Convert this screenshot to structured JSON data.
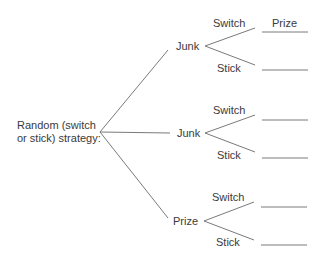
{
  "root": {
    "line1": "Random (switch",
    "line2": "or stick) strategy:"
  },
  "column_header": "Prize",
  "branches": [
    {
      "label": "Junk",
      "options": [
        {
          "label": "Switch",
          "result": ""
        },
        {
          "label": "Stick",
          "result": ""
        }
      ]
    },
    {
      "label": "Junk",
      "options": [
        {
          "label": "Switch",
          "result": ""
        },
        {
          "label": "Stick",
          "result": ""
        }
      ]
    },
    {
      "label": "Prize",
      "options": [
        {
          "label": "Switch",
          "result": ""
        },
        {
          "label": "Stick",
          "result": ""
        }
      ]
    }
  ],
  "colors": {
    "line": "#7a7a7a",
    "text": "#3a3a3a"
  }
}
